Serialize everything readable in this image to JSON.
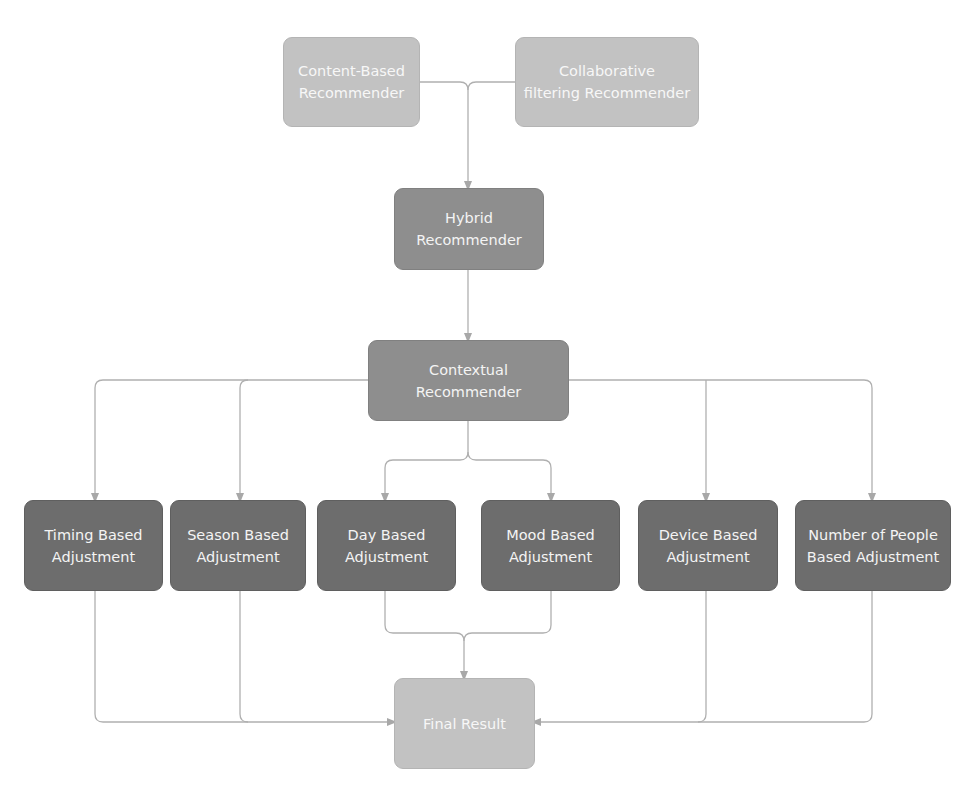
{
  "diagram": {
    "type": "flowchart",
    "colors": {
      "light_node": "#c2c2c2",
      "mid_node": "#8e8e8e",
      "dark_node": "#6d6d6d",
      "connector": "#aaaaaa",
      "text": "#f4f4f4"
    },
    "nodes": {
      "content_based": {
        "line1": "Content-Based",
        "line2": "Recommender"
      },
      "collaborative": {
        "line1": "Collaborative",
        "line2": "filtering Recommender"
      },
      "hybrid": {
        "line1": "Hybrid",
        "line2": "Recommender"
      },
      "contextual": {
        "line1": "Contextual",
        "line2": "Recommender"
      },
      "timing": {
        "line1": "Timing Based",
        "line2": "Adjustment"
      },
      "season": {
        "line1": "Season Based",
        "line2": "Adjustment"
      },
      "day": {
        "line1": "Day Based",
        "line2": "Adjustment"
      },
      "mood": {
        "line1": "Mood Based",
        "line2": "Adjustment"
      },
      "device": {
        "line1": "Device Based",
        "line2": "Adjustment"
      },
      "people": {
        "line1": "Number of People",
        "line2": "Based Adjustment"
      },
      "final": {
        "line1": "Final Result"
      }
    },
    "edges": [
      {
        "from": "Content-Based Recommender",
        "to": "Hybrid Recommender"
      },
      {
        "from": "Collaborative filtering Recommender",
        "to": "Hybrid Recommender"
      },
      {
        "from": "Hybrid Recommender",
        "to": "Contextual Recommender"
      },
      {
        "from": "Contextual Recommender",
        "to": "Timing Based Adjustment"
      },
      {
        "from": "Contextual Recommender",
        "to": "Season Based Adjustment"
      },
      {
        "from": "Contextual Recommender",
        "to": "Day Based Adjustment"
      },
      {
        "from": "Contextual Recommender",
        "to": "Mood Based Adjustment"
      },
      {
        "from": "Contextual Recommender",
        "to": "Device Based Adjustment"
      },
      {
        "from": "Contextual Recommender",
        "to": "Number of People Based Adjustment"
      },
      {
        "from": "Timing Based Adjustment",
        "to": "Final Result"
      },
      {
        "from": "Season Based Adjustment",
        "to": "Final Result"
      },
      {
        "from": "Day Based Adjustment",
        "to": "Final Result"
      },
      {
        "from": "Mood Based Adjustment",
        "to": "Final Result"
      },
      {
        "from": "Device Based Adjustment",
        "to": "Final Result"
      },
      {
        "from": "Number of People Based Adjustment",
        "to": "Final Result"
      }
    ]
  }
}
